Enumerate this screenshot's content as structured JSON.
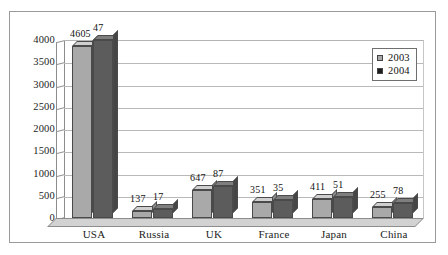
{
  "chart_data": {
    "type": "bar",
    "title": "",
    "subtitle": "",
    "xlabel": "",
    "ylabel": "",
    "categories": [
      "USA",
      "Russia",
      "UK",
      "France",
      "Japan",
      "China"
    ],
    "series": [
      {
        "name": "2003",
        "color": "#a9a9a9",
        "values": [
          4605,
          137,
          647,
          351,
          411,
          255
        ]
      },
      {
        "name": "2004",
        "color": "#5c5c5c",
        "values": [
          47,
          17,
          87,
          35,
          51,
          78
        ]
      }
    ],
    "data_labels": [
      {
        "category": "USA",
        "labels": [
          "4605",
          "47"
        ]
      },
      {
        "category": "Russia",
        "labels": [
          "137",
          "17"
        ]
      },
      {
        "category": "UK",
        "labels": [
          "647",
          "87"
        ]
      },
      {
        "category": "France",
        "labels": [
          "351",
          "35"
        ]
      },
      {
        "category": "Japan",
        "labels": [
          "411",
          "51"
        ]
      },
      {
        "category": "China",
        "labels": [
          "255",
          "78"
        ]
      }
    ],
    "bar_pixel_fractions": {
      "note": "rendered bar heights as fraction of the 0-4000 axis, read off the plot",
      "USA": [
        0.965,
        1.0
      ],
      "Russia": [
        0.038,
        0.048
      ],
      "UK": [
        0.16,
        0.18
      ],
      "France": [
        0.088,
        0.1
      ],
      "Japan": [
        0.105,
        0.12
      ],
      "China": [
        0.063,
        0.085
      ]
    },
    "ylim": [
      0,
      4000
    ],
    "ytick_step": 500,
    "yticks": [
      "4000",
      "3500",
      "3000",
      "2500",
      "2000",
      "1500",
      "1000",
      "500",
      "0"
    ],
    "grid": "horizontal",
    "legend_position": "top-right",
    "three_d": true
  },
  "legend": {
    "entries": [
      {
        "label": "2003",
        "swatch": "#a9a9a9"
      },
      {
        "label": "2004",
        "swatch": "#1d1d1d"
      }
    ]
  },
  "colors": {
    "series_2003": "#a9a9a9",
    "series_2004": "#5c5c5c",
    "gridline": "#b9b9b9",
    "frame": "#9a9a9a",
    "text": "#1b1b1b",
    "floor": "#d2d2d2"
  }
}
